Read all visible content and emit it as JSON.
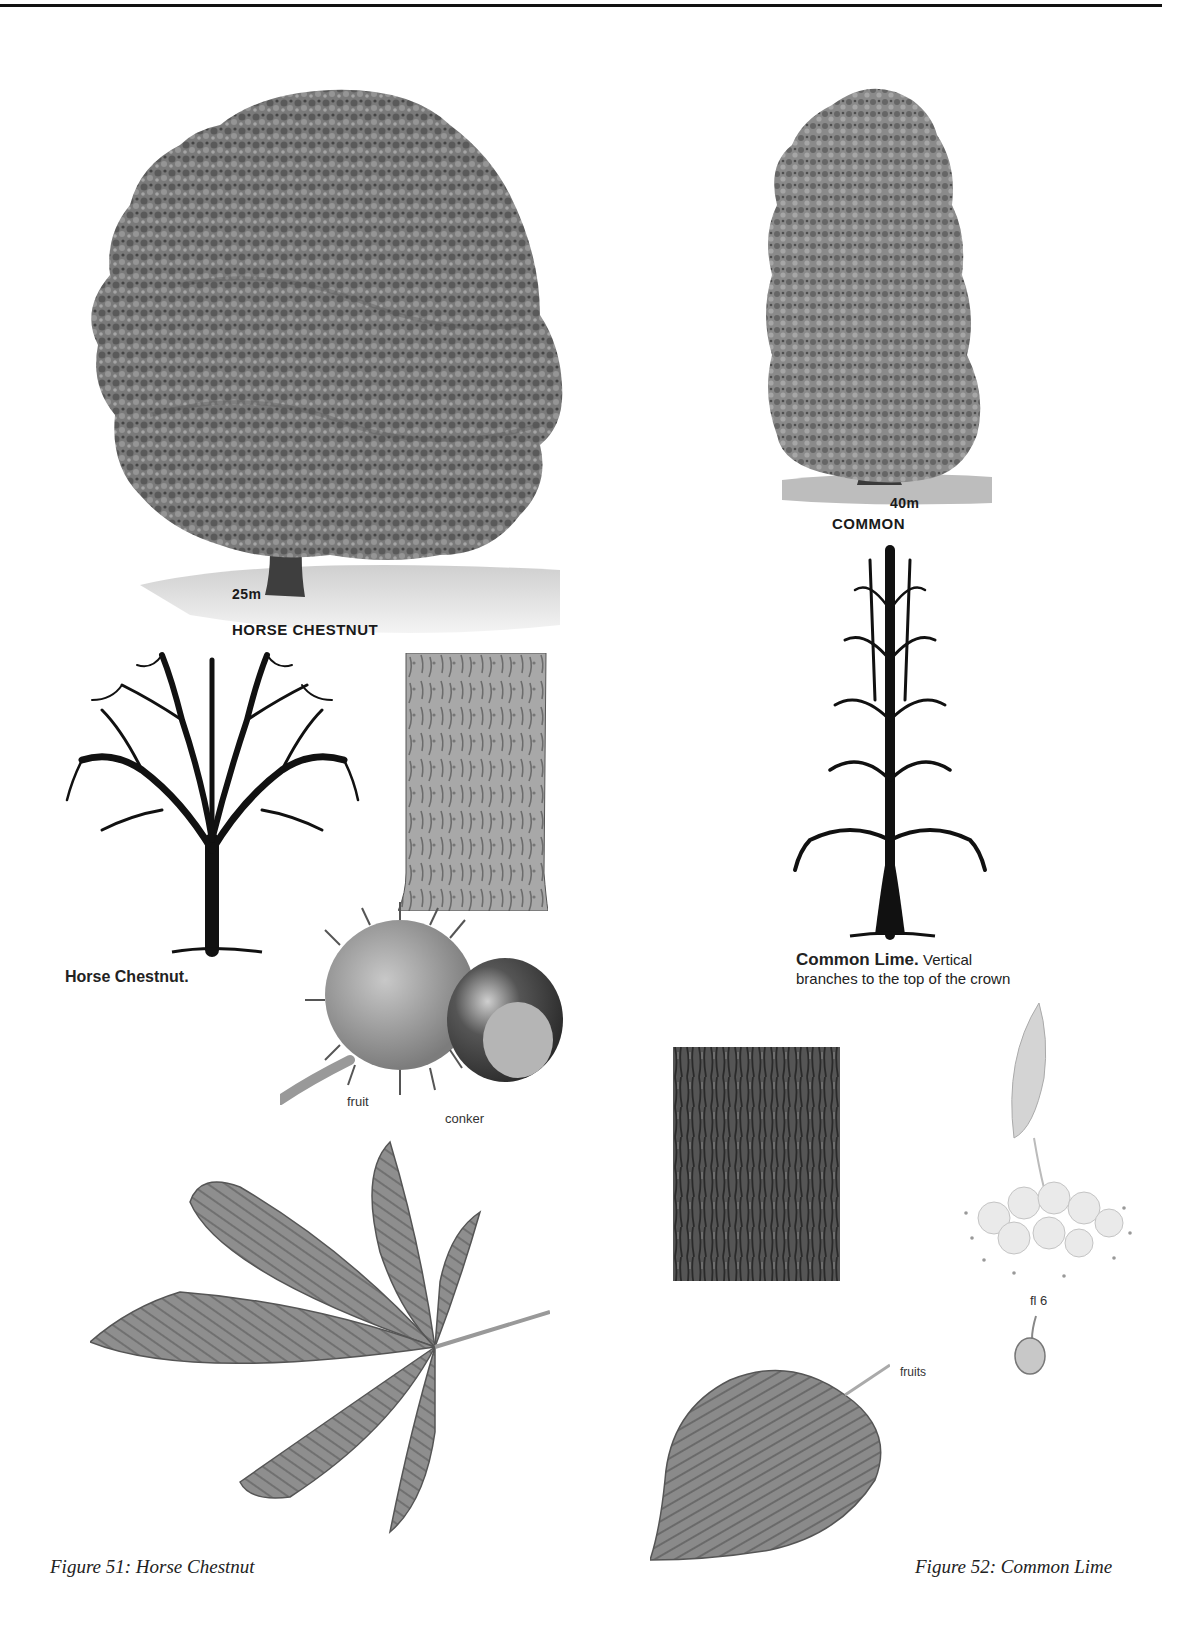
{
  "page": {
    "top_rule": true
  },
  "figure51": {
    "caption": "Figure 51: Horse Chestnut",
    "summer_tree": {
      "height_label": "25m",
      "name_label": "HORSE CHESTNUT"
    },
    "winter_tree": {
      "label": "Horse Chestnut."
    },
    "fruit": {
      "fruit_label": "fruit",
      "conker_label": "conker"
    }
  },
  "figure52": {
    "caption": "Figure 52: Common Lime",
    "summer_tree": {
      "height_label": "40m",
      "name_label": "COMMON"
    },
    "winter_tree": {
      "label_bold": "Common Lime.",
      "label_rest": " Vertical branches to the top of the crown"
    },
    "flower": {
      "label": "fl 6"
    },
    "fruits_label": "fruits"
  }
}
